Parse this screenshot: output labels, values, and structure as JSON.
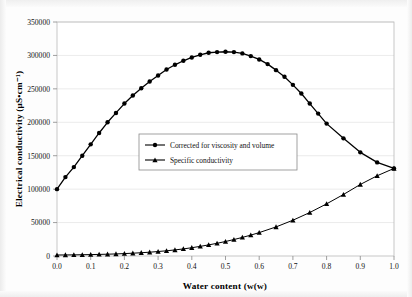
{
  "figure": {
    "name": "electrical-conductivity-vs-water-content"
  },
  "chart_data": {
    "type": "line",
    "title": "",
    "xlabel": "Water content (w(w)",
    "ylabel": "Electrical conductivity (μS•cm⁻¹)",
    "xlim": [
      0.0,
      1.0
    ],
    "ylim": [
      0,
      350000
    ],
    "xticks": [
      "0.0",
      "0.1",
      "0.2",
      "0.3",
      "0.4",
      "0.5",
      "0.6",
      "0.7",
      "0.8",
      "0.9",
      "1.0"
    ],
    "xtick_values": [
      0.0,
      0.1,
      0.2,
      0.3,
      0.4,
      0.5,
      0.6,
      0.7,
      0.8,
      0.9,
      1.0
    ],
    "yticks": [
      "0",
      "50000",
      "100000",
      "150000",
      "200000",
      "250000",
      "300000",
      "350000"
    ],
    "ytick_values": [
      0,
      50000,
      100000,
      150000,
      200000,
      250000,
      300000,
      350000
    ],
    "grid": true,
    "grid_axis": "y",
    "legend_position": "center-left-inside",
    "series": [
      {
        "name": "Corrected for viscosity and volume",
        "marker": "circle",
        "color": "#000000",
        "x": [
          0.0,
          0.025,
          0.05,
          0.075,
          0.1,
          0.125,
          0.15,
          0.175,
          0.2,
          0.225,
          0.25,
          0.275,
          0.3,
          0.325,
          0.35,
          0.375,
          0.4,
          0.425,
          0.45,
          0.475,
          0.5,
          0.525,
          0.55,
          0.575,
          0.6,
          0.625,
          0.65,
          0.675,
          0.7,
          0.725,
          0.75,
          0.775,
          0.8,
          0.85,
          0.9,
          0.95,
          1.0
        ],
        "y": [
          100000,
          118000,
          133000,
          150000,
          167000,
          184000,
          200000,
          214000,
          228000,
          240000,
          251000,
          261000,
          270000,
          279000,
          286000,
          292000,
          297000,
          301000,
          304000,
          305000,
          305500,
          305000,
          303000,
          299000,
          294000,
          287000,
          278000,
          268000,
          256000,
          243000,
          228000,
          213000,
          198000,
          176000,
          155000,
          140000,
          131000
        ]
      },
      {
        "name": "Specific conductivity",
        "marker": "triangle",
        "color": "#000000",
        "x": [
          0.0,
          0.025,
          0.05,
          0.075,
          0.1,
          0.125,
          0.15,
          0.175,
          0.2,
          0.225,
          0.25,
          0.275,
          0.3,
          0.325,
          0.35,
          0.375,
          0.4,
          0.425,
          0.45,
          0.475,
          0.5,
          0.525,
          0.55,
          0.575,
          0.6,
          0.65,
          0.7,
          0.75,
          0.8,
          0.85,
          0.9,
          0.95,
          1.0
        ],
        "y": [
          1500,
          1600,
          1700,
          1900,
          2100,
          2400,
          2700,
          3100,
          3600,
          4200,
          4900,
          5700,
          6700,
          7800,
          9100,
          10600,
          12400,
          14400,
          16600,
          19000,
          21700,
          24600,
          27800,
          31200,
          35000,
          43500,
          53500,
          65000,
          78000,
          92000,
          107000,
          120000,
          131000
        ]
      }
    ]
  },
  "legend": {
    "entries": [
      {
        "label": "Corrected for viscosity and volume",
        "marker": "circle"
      },
      {
        "label": "Specific conductivity",
        "marker": "triangle"
      }
    ]
  }
}
